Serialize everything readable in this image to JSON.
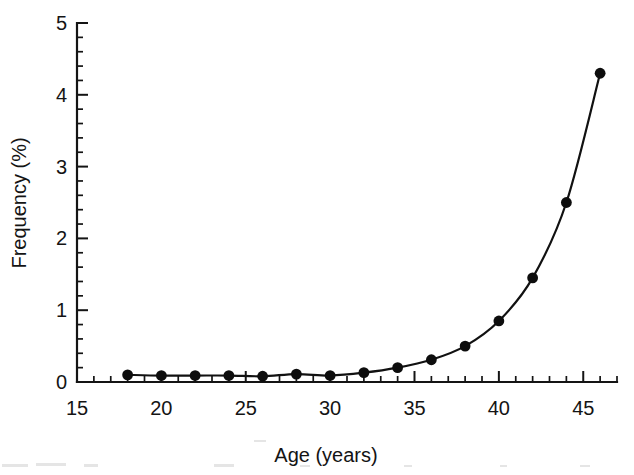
{
  "chart_data": {
    "type": "line",
    "title": "",
    "subtitle": "",
    "xlabel": "Age (years)",
    "ylabel": "Frequency (%)",
    "xlim": [
      15,
      47
    ],
    "ylim": [
      0,
      5
    ],
    "grid": false,
    "legend": null,
    "x_major_ticks": [
      15,
      20,
      25,
      30,
      35,
      40,
      45
    ],
    "x_major_tick_labels": [
      "15",
      "20",
      "25",
      "30",
      "35",
      "40",
      "45"
    ],
    "x_minor_tick_step": 1,
    "y_major_ticks": [
      0,
      1,
      2,
      3,
      4,
      5
    ],
    "y_major_tick_labels": [
      "0",
      "1",
      "2",
      "3",
      "4",
      "5"
    ],
    "y_minor_tick_step": 0.2,
    "marker": "filled-circle",
    "line_color": "#111111",
    "marker_color": "#0d0d0d",
    "x": [
      18,
      20,
      22,
      24,
      26,
      28,
      30,
      32,
      34,
      36,
      38,
      40,
      42,
      44,
      46
    ],
    "values": [
      0.1,
      0.09,
      0.09,
      0.09,
      0.08,
      0.11,
      0.09,
      0.13,
      0.2,
      0.31,
      0.5,
      0.85,
      1.45,
      2.5,
      4.3
    ],
    "series": [
      {
        "name": "Frequency",
        "x": [
          18,
          20,
          22,
          24,
          26,
          28,
          30,
          32,
          34,
          36,
          38,
          40,
          42,
          44,
          46
        ],
        "values": [
          0.1,
          0.09,
          0.09,
          0.09,
          0.08,
          0.11,
          0.09,
          0.13,
          0.2,
          0.31,
          0.5,
          0.85,
          1.45,
          2.5,
          4.3
        ]
      }
    ],
    "annotations": []
  },
  "axes": {
    "y_labels": [
      "5",
      "4",
      "3",
      "2",
      "1",
      "0"
    ],
    "x_labels": [
      "15",
      "20",
      "25",
      "30",
      "35",
      "40",
      "45"
    ],
    "x_title": "Age (years)",
    "y_title": "Frequency (%)"
  }
}
